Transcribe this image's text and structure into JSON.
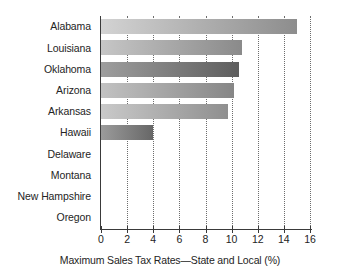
{
  "chart_data": {
    "type": "bar",
    "orientation": "horizontal",
    "title": "",
    "xlabel": "Maximum Sales Tax Rates—State and Local (%)",
    "ylabel": "",
    "xlim": [
      0,
      16
    ],
    "xticks": [
      0,
      2,
      4,
      6,
      8,
      10,
      12,
      14,
      16
    ],
    "xtick_labels": [
      "0",
      "2",
      "4",
      "6",
      "8",
      "10",
      "12",
      "14",
      "16"
    ],
    "grid": "vertical-dotted",
    "legend": "none",
    "categories": [
      "Alabama",
      "Louisiana",
      "Oklahoma",
      "Arizona",
      "Arkansas",
      "Hawaii",
      "Delaware",
      "Montana",
      "New Hampshire",
      "Oregon"
    ],
    "values": [
      15.0,
      10.8,
      10.6,
      10.2,
      9.7,
      4.0,
      0,
      0,
      0,
      0
    ],
    "bar_colors": [
      {
        "from": "#d3d3d3",
        "to": "#8d8d8d"
      },
      {
        "from": "#c6c6c6",
        "to": "#8a8a8a"
      },
      {
        "from": "#9e9e9e",
        "to": "#5e5e5e"
      },
      {
        "from": "#c2c2c2",
        "to": "#868686"
      },
      {
        "from": "#c9c9c9",
        "to": "#8f8f8f"
      },
      {
        "from": "#9b9b9b",
        "to": "#676767"
      },
      {
        "from": "#c0c0c0",
        "to": "#8a8a8a"
      },
      {
        "from": "#c0c0c0",
        "to": "#8a8a8a"
      },
      {
        "from": "#c0c0c0",
        "to": "#8a8a8a"
      },
      {
        "from": "#c0c0c0",
        "to": "#8a8a8a"
      }
    ],
    "axis_color": "#3a3a3a",
    "gridline_color": "#6d6d6d",
    "text_color": "#242424",
    "background": "#ffffff"
  }
}
